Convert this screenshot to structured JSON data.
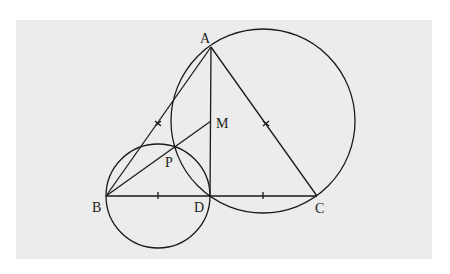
{
  "diagram": {
    "type": "geometry",
    "background": "#ececec",
    "stroke_color": "#1a1a1a",
    "points": {
      "A": {
        "label": "A",
        "x": 211,
        "y": 47
      },
      "B": {
        "label": "B",
        "x": 106,
        "y": 196
      },
      "C": {
        "label": "C",
        "x": 317,
        "y": 196
      },
      "D": {
        "label": "D",
        "x": 210,
        "y": 196
      },
      "M": {
        "label": "M",
        "x": 211,
        "y": 121
      },
      "P": {
        "label": "P",
        "x": 176,
        "y": 145
      }
    },
    "segments": [
      "AB",
      "AC",
      "BC",
      "AD",
      "BM"
    ],
    "circles": [
      {
        "name": "circle through B, P, D (diameter BD)",
        "cx": 158,
        "cy": 196,
        "r": 52
      },
      {
        "name": "circle through A, D, C",
        "cx": 263,
        "cy": 121,
        "r": 92
      }
    ],
    "tick_marks": [
      "midpoint of BD",
      "midpoint of DC",
      "midpoint of AB",
      "midpoint of AC"
    ]
  }
}
